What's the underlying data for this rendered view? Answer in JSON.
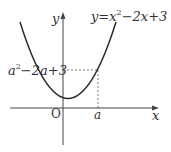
{
  "diagram": {
    "type": "function-graph",
    "equation_label": {
      "lhs": "y",
      "eq": "=",
      "x": "x",
      "exp": "2",
      "rest": "−2x+3"
    },
    "value_label": {
      "a": "a",
      "exp": "2",
      "rest": "−2a+3"
    },
    "axis_labels": {
      "x": "x",
      "y": "y",
      "origin": "O"
    },
    "point_label": "a",
    "colors": {
      "curve": "#2a2a2a",
      "axis": "#444444",
      "dash": "#555555",
      "background": "#ffffff"
    }
  }
}
